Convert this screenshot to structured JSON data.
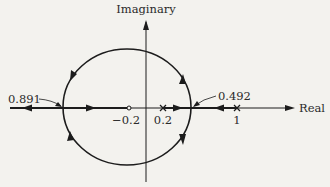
{
  "diagram": {
    "type": "root-locus",
    "axes": {
      "real_label": "Real",
      "imaginary_label": "Imaginary"
    },
    "breakpoints": [
      {
        "label": "0.891",
        "position": "left break-in point"
      },
      {
        "label": "0.492",
        "position": "right break-away point"
      }
    ],
    "zeros": [
      {
        "label": "−0.2",
        "value": -0.2
      }
    ],
    "poles": [
      {
        "label": "0.2",
        "value": 0.2
      },
      {
        "label": "1",
        "value": 1
      }
    ],
    "colors": {
      "background": "#f3f2ee",
      "stroke": "#1c1c1c"
    }
  }
}
